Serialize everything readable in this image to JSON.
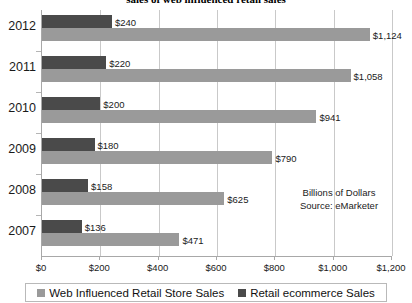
{
  "chart_data": {
    "type": "bar",
    "orientation": "horizontal",
    "title": "sales of web influenced retail sales",
    "categories": [
      "2012",
      "2011",
      "2010",
      "2009",
      "2008",
      "2007"
    ],
    "series": [
      {
        "name": "Web Influenced Retail Store Sales",
        "color": "#9a9a9a",
        "values": [
          1124,
          1058,
          941,
          790,
          625,
          471
        ],
        "labels": [
          "$1,124",
          "$1,058",
          "$941",
          "$790",
          "$625",
          "$471"
        ]
      },
      {
        "name": "Retail ecommerce Sales",
        "color": "#4a4a4a",
        "values": [
          240,
          220,
          200,
          180,
          158,
          136
        ],
        "labels": [
          "$240",
          "$220",
          "$200",
          "$180",
          "$158",
          "$136"
        ]
      }
    ],
    "xlabel": "",
    "ylabel": "",
    "xlim": [
      0,
      1200
    ],
    "xticks": [
      0,
      200,
      400,
      600,
      800,
      1000,
      1200
    ],
    "xtick_labels": [
      "$0",
      "$200",
      "$400",
      "$600",
      "$800",
      "$1,000",
      "$1,200"
    ],
    "grid": true,
    "legend_position": "bottom",
    "annotations": [
      "Billions of Dollars",
      "Source: eMarketer"
    ]
  },
  "annotation": {
    "units": "Billions of Dollars",
    "source": "Source: eMarketer"
  },
  "legend": {
    "items": [
      {
        "label": "Web Influenced Retail Store Sales",
        "color": "#9a9a9a"
      },
      {
        "label": "Retail ecommerce Sales",
        "color": "#4a4a4a"
      }
    ]
  }
}
